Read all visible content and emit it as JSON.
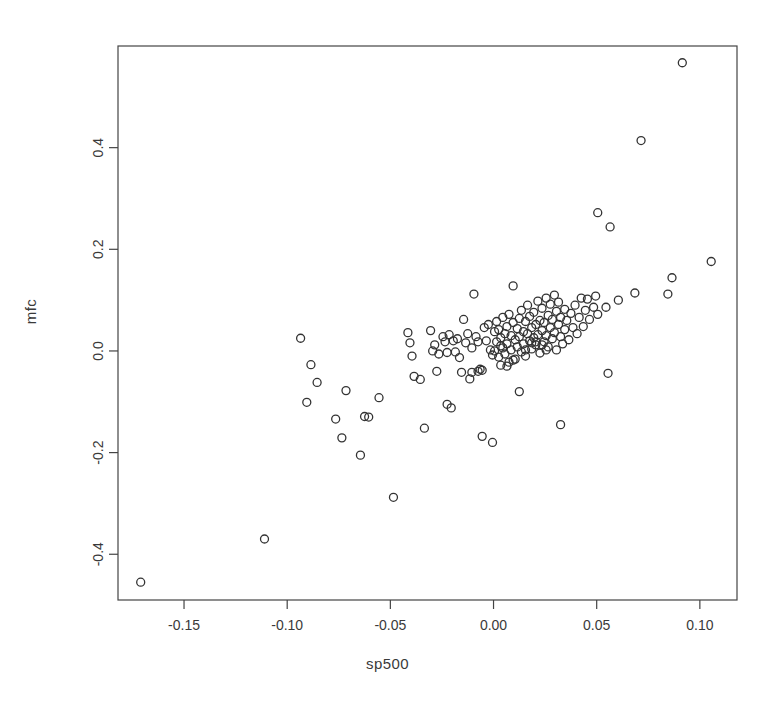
{
  "chart_data": {
    "type": "scatter",
    "title": "",
    "xlabel": "sp500",
    "ylabel": "mfc",
    "xlim": [
      -0.182,
      0.118
    ],
    "ylim": [
      -0.49,
      0.6
    ],
    "xticks": [
      -0.15,
      -0.1,
      -0.05,
      0.0,
      0.05,
      0.1
    ],
    "xticklabels": [
      "-0.15",
      "-0.10",
      "-0.05",
      "0.00",
      "0.05",
      "0.10"
    ],
    "yticks": [
      -0.4,
      -0.2,
      0.0,
      0.2,
      0.4
    ],
    "yticklabels": [
      "-0.4",
      "-0.2",
      "0.0",
      "0.2",
      "0.4"
    ],
    "grid": false,
    "legend": false,
    "marker": "open-circle",
    "marker_color": "#333333",
    "marker_size_px": 8,
    "n_points": 158,
    "points": [
      [
        -0.171,
        -0.455
      ],
      [
        -0.111,
        -0.37
      ],
      [
        -0.0935,
        0.025
      ],
      [
        -0.0885,
        -0.027
      ],
      [
        -0.0855,
        -0.062
      ],
      [
        -0.0905,
        -0.101
      ],
      [
        -0.0765,
        -0.134
      ],
      [
        -0.0735,
        -0.171
      ],
      [
        -0.0715,
        -0.078
      ],
      [
        -0.0645,
        -0.205
      ],
      [
        -0.0625,
        -0.129
      ],
      [
        -0.0605,
        -0.13
      ],
      [
        -0.0555,
        -0.092
      ],
      [
        -0.0485,
        -0.288
      ],
      [
        -0.0415,
        0.036
      ],
      [
        -0.0405,
        0.016
      ],
      [
        -0.0395,
        -0.01
      ],
      [
        -0.0385,
        -0.05
      ],
      [
        -0.0355,
        -0.056
      ],
      [
        -0.0335,
        -0.152
      ],
      [
        -0.0295,
        0.0
      ],
      [
        -0.0275,
        -0.04
      ],
      [
        -0.0245,
        0.028
      ],
      [
        -0.0235,
        0.018
      ],
      [
        -0.0225,
        -0.003
      ],
      [
        -0.0215,
        0.032
      ],
      [
        -0.0225,
        -0.105
      ],
      [
        -0.0205,
        -0.112
      ],
      [
        -0.0195,
        0.02
      ],
      [
        -0.0185,
        -0.002
      ],
      [
        -0.0175,
        0.024
      ],
      [
        -0.0165,
        -0.013
      ],
      [
        -0.0155,
        -0.042
      ],
      [
        -0.0145,
        0.062
      ],
      [
        -0.0135,
        0.016
      ],
      [
        -0.0125,
        0.034
      ],
      [
        -0.0115,
        -0.055
      ],
      [
        -0.0105,
        0.006
      ],
      [
        -0.0095,
        0.112
      ],
      [
        -0.0085,
        0.028
      ],
      [
        -0.0075,
        0.018
      ],
      [
        -0.0065,
        -0.036
      ],
      [
        -0.0055,
        -0.038
      ],
      [
        -0.0055,
        -0.168
      ],
      [
        -0.0045,
        0.046
      ],
      [
        -0.0035,
        0.02
      ],
      [
        -0.0025,
        0.052
      ],
      [
        -0.0015,
        0.002
      ],
      [
        -0.0005,
        -0.008
      ],
      [
        -0.0005,
        -0.18
      ],
      [
        0.0005,
        0.038
      ],
      [
        0.0005,
        0.0
      ],
      [
        0.0015,
        0.058
      ],
      [
        0.0015,
        0.018
      ],
      [
        0.0025,
        -0.012
      ],
      [
        0.0025,
        0.042
      ],
      [
        0.0035,
        -0.028
      ],
      [
        0.0035,
        0.026
      ],
      [
        0.0045,
        0.006
      ],
      [
        0.0045,
        0.066
      ],
      [
        0.0055,
        0.034
      ],
      [
        0.0055,
        -0.006
      ],
      [
        0.0065,
        0.048
      ],
      [
        0.0065,
        0.014
      ],
      [
        0.0075,
        -0.022
      ],
      [
        0.0075,
        0.072
      ],
      [
        0.0085,
        0.03
      ],
      [
        0.0085,
        0.002
      ],
      [
        0.0095,
        0.128
      ],
      [
        0.0095,
        0.056
      ],
      [
        0.0105,
        0.022
      ],
      [
        0.0105,
        -0.016
      ],
      [
        0.0115,
        0.044
      ],
      [
        0.0115,
        0.008
      ],
      [
        0.0125,
        0.064
      ],
      [
        0.0125,
        0.028
      ],
      [
        0.0135,
        -0.002
      ],
      [
        0.0135,
        0.08
      ],
      [
        0.0145,
        0.038
      ],
      [
        0.0145,
        0.014
      ],
      [
        0.0155,
        0.058
      ],
      [
        0.0155,
        -0.01
      ],
      [
        0.0165,
        0.09
      ],
      [
        0.0165,
        0.034
      ],
      [
        0.0175,
        0.02
      ],
      [
        0.0175,
        0.068
      ],
      [
        0.0185,
        0.046
      ],
      [
        0.0185,
        0.004
      ],
      [
        0.0195,
        0.026
      ],
      [
        0.0195,
        0.076
      ],
      [
        0.0205,
        0.052
      ],
      [
        0.0205,
        0.012
      ],
      [
        0.0215,
        0.098
      ],
      [
        0.0215,
        0.032
      ],
      [
        0.0225,
        0.06
      ],
      [
        0.0225,
        -0.004
      ],
      [
        0.0235,
        0.04
      ],
      [
        0.0235,
        0.084
      ],
      [
        0.0245,
        0.018
      ],
      [
        0.0245,
        0.056
      ],
      [
        0.0255,
        0.104
      ],
      [
        0.0255,
        0.03
      ],
      [
        0.0265,
        0.07
      ],
      [
        0.0265,
        0.008
      ],
      [
        0.0275,
        0.046
      ],
      [
        0.0275,
        0.092
      ],
      [
        0.0285,
        0.024
      ],
      [
        0.0285,
        0.062
      ],
      [
        0.0295,
        0.11
      ],
      [
        0.0295,
        0.036
      ],
      [
        0.0305,
        0.078
      ],
      [
        0.0305,
        0.002
      ],
      [
        0.0315,
        0.052
      ],
      [
        0.0315,
        0.096
      ],
      [
        0.0325,
        0.028
      ],
      [
        0.0325,
        0.066
      ],
      [
        0.0335,
        0.014
      ],
      [
        0.0345,
        0.082
      ],
      [
        0.0345,
        0.042
      ],
      [
        0.0355,
        0.06
      ],
      [
        0.0365,
        0.022
      ],
      [
        0.0375,
        0.074
      ],
      [
        0.0385,
        0.046
      ],
      [
        0.0395,
        0.09
      ],
      [
        0.0405,
        0.034
      ],
      [
        0.0415,
        0.066
      ],
      [
        0.0425,
        0.104
      ],
      [
        0.0435,
        0.048
      ],
      [
        0.0445,
        0.08
      ],
      [
        0.0455,
        0.102
      ],
      [
        0.0465,
        0.062
      ],
      [
        0.0485,
        0.086
      ],
      [
        0.0495,
        0.108
      ],
      [
        0.0505,
        0.072
      ],
      [
        0.0545,
        0.086
      ],
      [
        0.0555,
        -0.044
      ],
      [
        0.0605,
        0.1
      ],
      [
        0.0685,
        0.114
      ],
      [
        0.0845,
        0.112
      ],
      [
        0.0865,
        0.144
      ],
      [
        0.1055,
        0.176
      ],
      [
        0.0505,
        0.272
      ],
      [
        0.0565,
        0.244
      ],
      [
        0.0715,
        0.414
      ],
      [
        0.0915,
        0.567
      ],
      [
        0.0325,
        -0.145
      ],
      [
        0.0125,
        -0.08
      ],
      [
        -0.0075,
        -0.04
      ],
      [
        -0.0105,
        -0.042
      ],
      [
        0.0155,
        0.002
      ],
      [
        0.0185,
        0.016
      ],
      [
        0.0205,
        0.018
      ],
      [
        0.0235,
        0.012
      ],
      [
        0.0255,
        0.002
      ],
      [
        -0.0305,
        0.04
      ],
      [
        -0.0285,
        0.012
      ],
      [
        -0.0265,
        -0.006
      ],
      [
        0.0065,
        -0.03
      ],
      [
        0.0095,
        -0.018
      ],
      [
        0.0035,
        0.01
      ]
    ]
  },
  "figure": {
    "background_color": "#ffffff",
    "axis_color": "#444444",
    "text_color": "#3a3a3a"
  }
}
